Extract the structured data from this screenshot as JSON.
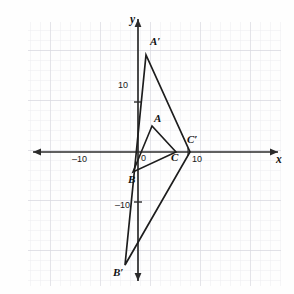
{
  "figure": {
    "kind": "coordinate-plane-dilation-diagram",
    "background_color": "#fefefe",
    "grid": {
      "visible": true,
      "minor_color": "#e9e9ec",
      "major_color": "#dcdce2",
      "minor_spacing_px": 10,
      "major_every": 5,
      "left_px": 28,
      "top_px": 22,
      "right_px": 281,
      "bottom_px": 286
    },
    "axes": {
      "origin_px": {
        "x": 138,
        "y": 152
      },
      "units_per_px": 0.2,
      "px_per_unit": 5,
      "color": "#2b2b2b",
      "x_axis": {
        "name": "x",
        "start_px": {
          "x": 33,
          "y": 152
        },
        "end_px": {
          "x": 278,
          "y": 152
        },
        "arrow_both_ends": true,
        "label_pos_px": {
          "x": 277,
          "y": 153
        }
      },
      "y_axis": {
        "name": "y",
        "start_px": {
          "x": 138,
          "y": 19
        },
        "end_px": {
          "x": 138,
          "y": 281
        },
        "arrow_both_ends": true,
        "label_pos_px": {
          "x": 131,
          "y": 17
        }
      },
      "tick_labels": [
        {
          "id": "x-neg-ten",
          "text": "–10",
          "x_px": 78,
          "y_px": 156
        },
        {
          "id": "x-pos-ten",
          "text": "10",
          "x_px": 194,
          "y_px": 156
        },
        {
          "id": "y-pos-ten",
          "text": "10",
          "x_px": 120,
          "y_px": 80
        },
        {
          "id": "y-neg-ten",
          "text": "–10",
          "x_px": 118,
          "y_px": 200
        },
        {
          "id": "origin-zero",
          "text": "0",
          "x_px": 142,
          "y_px": 156
        }
      ]
    },
    "shapes": {
      "stroke_color": "#1d1d1d",
      "stroke_width": 1.6,
      "triangle_ABC": {
        "name": "triangle-abc",
        "vertices_px": [
          {
            "id": "A",
            "x": 152,
            "y": 126
          },
          {
            "id": "B",
            "x": 133,
            "y": 172
          },
          {
            "id": "C",
            "x": 176,
            "y": 152
          }
        ],
        "vertices_units": [
          {
            "id": "A",
            "x": 2.8,
            "y": 5.2
          },
          {
            "id": "B",
            "x": -1.0,
            "y": -4.0
          },
          {
            "id": "C",
            "x": 7.6,
            "y": 0.0
          }
        ]
      },
      "triangle_ApBpCp": {
        "name": "triangle-a-prime-b-prime-c-prime",
        "vertices_px": [
          {
            "id": "A'",
            "x": 146,
            "y": 55
          },
          {
            "id": "B'",
            "x": 125,
            "y": 265
          },
          {
            "id": "C'",
            "x": 190,
            "y": 152
          }
        ],
        "vertices_units": [
          {
            "id": "A'",
            "x": 1.6,
            "y": 19.4
          },
          {
            "id": "B'",
            "x": -2.6,
            "y": -22.6
          },
          {
            "id": "C'",
            "x": 10.4,
            "y": 0.0
          }
        ]
      }
    },
    "vertex_labels": [
      {
        "id": "label-A-prime",
        "text": "A′",
        "x_px": 150,
        "y_px": 41
      },
      {
        "id": "label-A",
        "text": "A",
        "x_px": 154,
        "y_px": 116
      },
      {
        "id": "label-B",
        "text": "B",
        "x_px": 129,
        "y_px": 175
      },
      {
        "id": "label-B-prime",
        "text": "B′",
        "x_px": 114,
        "y_px": 270
      },
      {
        "id": "label-C",
        "text": "C",
        "x_px": 172,
        "y_px": 154
      },
      {
        "id": "label-C-prime",
        "text": "C′",
        "x_px": 188,
        "y_px": 138
      }
    ]
  }
}
